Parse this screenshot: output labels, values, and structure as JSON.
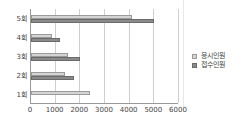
{
  "chart_data": {
    "type": "bar",
    "orientation": "horizontal",
    "title": "",
    "xlabel": "",
    "ylabel": "",
    "categories": [
      "1회",
      "2회",
      "3회",
      "4회",
      "5회"
    ],
    "series": [
      {
        "name": "응시인원",
        "color": "#d4d4d4",
        "values": [
          2400,
          1380,
          1500,
          850,
          4100
        ]
      },
      {
        "name": "접수인원",
        "color": "#8a8a8a",
        "values": [
          0,
          1750,
          2000,
          1180,
          5000
        ]
      }
    ],
    "xlim": [
      0,
      6000
    ],
    "xticks": [
      "0",
      "1000",
      "2000",
      "3000",
      "4000",
      "5000",
      "6000"
    ],
    "grid": true,
    "legend_position": "right"
  },
  "legend": {
    "items": [
      {
        "label": "응시인원",
        "color": "#d4d4d4"
      },
      {
        "label": "접수인원",
        "color": "#8a8a8a"
      }
    ]
  }
}
